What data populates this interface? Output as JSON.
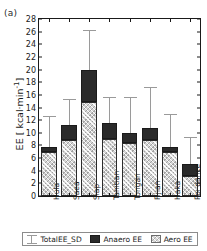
{
  "panel": {
    "label": "(a)"
  },
  "chart_data": {
    "type": "bar",
    "stacked": true,
    "title": "",
    "xlabel": "",
    "ylabel": "EE [ kcal·min",
    "ylabel_sup": "-1",
    "ylabel_tail": "]",
    "ylim": [
      0,
      28
    ],
    "ytick_step": 2,
    "yticks": [
      0,
      2,
      4,
      6,
      8,
      10,
      12,
      14,
      16,
      18,
      20,
      22,
      24,
      26,
      28
    ],
    "grid": false,
    "legend_position": "bottom",
    "categories": [
      "Hula",
      "Saea",
      "Siap",
      "Tahitian",
      "Tongan",
      "Fijian",
      "Haka",
      "Poi dance"
    ],
    "series": [
      {
        "name": "Aero EE",
        "key": "aero",
        "color": "#d4d4d4",
        "values": [
          6.9,
          8.8,
          14.8,
          9.0,
          8.4,
          8.9,
          7.0,
          3.2
        ]
      },
      {
        "name": "Anaero EE",
        "key": "anaero",
        "color": "#2a2a2a",
        "values": [
          0.8,
          2.4,
          5.1,
          2.5,
          1.5,
          1.9,
          0.8,
          1.8
        ]
      }
    ],
    "totals": [
      7.7,
      11.2,
      19.9,
      11.5,
      9.9,
      10.8,
      7.8,
      5.0
    ],
    "error_bars": {
      "name": "TotalEE_SD",
      "color": "#9a9a9a",
      "upper": [
        12.6,
        15.4,
        26.2,
        15.7,
        15.6,
        17.3,
        13.0,
        9.4
      ]
    }
  },
  "legend": {
    "items": [
      {
        "label": "TotalEE_SD",
        "marker": "errorbar-marker"
      },
      {
        "label": "Anaero EE",
        "marker": "dark-swatch"
      },
      {
        "label": "Aero EE",
        "marker": "hatched-swatch"
      }
    ]
  }
}
